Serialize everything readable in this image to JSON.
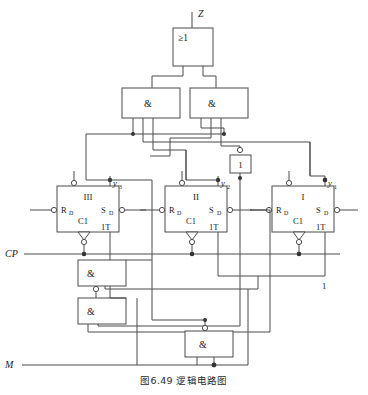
{
  "header": {
    "left_text": "",
    "right_text": ""
  },
  "figure": {
    "caption": "图6.49  逻辑电路图",
    "caption_number": "图6.49",
    "caption_title": "逻辑电路图"
  },
  "signals": {
    "output_z": "Z",
    "clock": "CP",
    "mode": "M",
    "constant_one": "1",
    "y3": "y",
    "y3_sub": "3",
    "y2": "y",
    "y2_sub": "2",
    "y1": "y",
    "y1_sub": "1"
  },
  "gates": {
    "or_gate": {
      "label": "≥1",
      "name": "or-gate-z"
    },
    "and_top_left": {
      "label": "&",
      "name": "and-gate-top-left"
    },
    "and_top_right": {
      "label": "&",
      "name": "and-gate-top-right"
    },
    "buffer": {
      "label": "1",
      "name": "inverter-gate"
    },
    "and_mid_left": {
      "label": "&",
      "name": "and-gate-mid-left"
    },
    "and_low_left": {
      "label": "&",
      "name": "and-gate-low-left"
    },
    "and_bottom": {
      "label": "&",
      "name": "and-gate-bottom"
    }
  },
  "flipflops": [
    {
      "id": "III",
      "title": "III",
      "reset": "R",
      "reset_sub": "D",
      "set": "S",
      "set_sub": "D",
      "clock_in": "C1",
      "toggle_in": "1T",
      "output": "y",
      "output_sub": "3"
    },
    {
      "id": "II",
      "title": "II",
      "reset": "R",
      "reset_sub": "D",
      "set": "S",
      "set_sub": "D",
      "clock_in": "C1",
      "toggle_in": "1T",
      "output": "y",
      "output_sub": "2"
    },
    {
      "id": "I",
      "title": "I",
      "reset": "R",
      "reset_sub": "D",
      "set": "S",
      "set_sub": "D",
      "clock_in": "C1",
      "toggle_in": "1T",
      "output": "y",
      "output_sub": "1"
    }
  ],
  "colors": {
    "line": "#4a4a4a",
    "text": "#1a1a1a",
    "background": "#ffffff",
    "node": "#333333"
  }
}
